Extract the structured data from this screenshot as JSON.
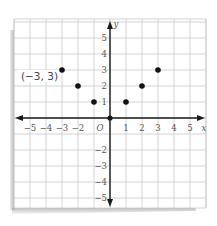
{
  "chart_data": {
    "type": "scatter",
    "title": "",
    "xlabel": "x",
    "ylabel": "y",
    "xlim": [
      -6,
      6
    ],
    "ylim": [
      -6,
      6
    ],
    "grid": true,
    "x_ticks": [
      "-5",
      "-4",
      "-3",
      "-2",
      "1",
      "2",
      "3",
      "4",
      "5"
    ],
    "y_ticks": [
      "5",
      "4",
      "3",
      "2",
      "1",
      "-2",
      "-3",
      "-4",
      "-5"
    ],
    "origin_label": "O",
    "series": [
      {
        "name": "points",
        "points": [
          {
            "x": -3,
            "y": 3
          },
          {
            "x": -2,
            "y": 2
          },
          {
            "x": -1,
            "y": 1
          },
          {
            "x": 1,
            "y": 1
          },
          {
            "x": 2,
            "y": 2
          },
          {
            "x": 3,
            "y": 3
          }
        ]
      }
    ],
    "annotations": [
      {
        "text": "(−3, 3)",
        "x": -3,
        "y": 3
      }
    ],
    "colors": {
      "grid": "#c8c8c8",
      "axis": "#1a1a1a",
      "point": "#111111",
      "label": "#555555"
    }
  }
}
